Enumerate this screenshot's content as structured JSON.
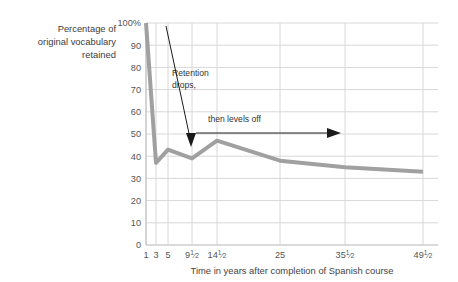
{
  "chart_data": {
    "type": "line",
    "title": "",
    "xlabel": "Time in years after completion of Spanish course",
    "ylabel": "Percentage of original vocabulary retained",
    "x_tick_labels": [
      "1",
      "3",
      "5",
      "9½",
      "14½",
      "25",
      "35½",
      "49½"
    ],
    "x_values": [
      1,
      3,
      5,
      9.5,
      14.5,
      25,
      35.5,
      49.5
    ],
    "categories": [
      "1",
      "3",
      "5",
      "9½",
      "14½",
      "25",
      "35½",
      "49½"
    ],
    "values": [
      100,
      37,
      43,
      39,
      47,
      38,
      35,
      33
    ],
    "y_tick_labels": [
      "0",
      "10",
      "20",
      "30",
      "40",
      "50",
      "60",
      "70",
      "80",
      "90",
      "100%"
    ],
    "y_ticks": [
      0,
      10,
      20,
      30,
      40,
      50,
      60,
      70,
      80,
      90,
      100
    ],
    "ylim": [
      0,
      100
    ],
    "grid": "both",
    "legend": "none",
    "series_color": "#a0a0a0",
    "grid_color": "#d8d8d8",
    "annotations": [
      {
        "text_line1": "Retention",
        "text_line2": "drops,",
        "arrow": "down-right-to-left-diagonal"
      },
      {
        "text_line1": "then levels off",
        "text_line2": "",
        "arrow": "right"
      }
    ]
  },
  "ylabel_lines": [
    "Percentage of",
    "original vocabulary",
    "retained"
  ],
  "xlabel": "Time in years after completion of Spanish course",
  "y_ticks": [
    {
      "label": "100%",
      "value": 100
    },
    {
      "label": "90",
      "value": 90
    },
    {
      "label": "80",
      "value": 80
    },
    {
      "label": "70",
      "value": 70
    },
    {
      "label": "60",
      "value": 60
    },
    {
      "label": "50",
      "value": 50
    },
    {
      "label": "40",
      "value": 40
    },
    {
      "label": "30",
      "value": 30
    },
    {
      "label": "20",
      "value": 20
    },
    {
      "label": "10",
      "value": 10
    },
    {
      "label": "0",
      "value": 0
    }
  ],
  "x_ticks": [
    {
      "label": "1",
      "whole": "1",
      "num": "",
      "den": ""
    },
    {
      "label": "3",
      "whole": "3",
      "num": "",
      "den": ""
    },
    {
      "label": "5",
      "whole": "5",
      "num": "",
      "den": ""
    },
    {
      "label": "9½",
      "whole": "9",
      "num": "1",
      "den": "2"
    },
    {
      "label": "14½",
      "whole": "14",
      "num": "1",
      "den": "2"
    },
    {
      "label": "25",
      "whole": "25",
      "num": "",
      "den": ""
    },
    {
      "label": "35½",
      "whole": "35",
      "num": "1",
      "den": "2"
    },
    {
      "label": "49½",
      "whole": "49",
      "num": "1",
      "den": "2"
    }
  ],
  "annotation_retention": {
    "line1": "Retention",
    "line2": "drops,"
  },
  "annotation_levels": {
    "line1": "then levels off"
  },
  "colors": {
    "series": "#a0a0a0",
    "grid": "#d8d8d8",
    "axis": "#bdbdbd",
    "text": "#3d3d3d",
    "annotation": "#1a1a1a"
  }
}
